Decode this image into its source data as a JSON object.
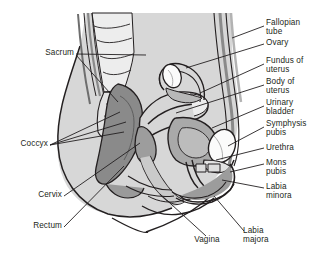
{
  "figure": {
    "width": 323,
    "height": 264,
    "background_color": "#ffffff",
    "line_color": "#231f20",
    "label_color": "#231f20"
  },
  "palette": {
    "skin_outer": "#d9d9d9",
    "body_fill": "#cfcfcf",
    "muscle_light": "#e2e2e2",
    "bone_light": "#ededed",
    "organ_mid": "#b3b3b3",
    "organ_dark": "#8a8a8a",
    "organ_darker": "#6e6e6e",
    "white_structure": "#fbfbfb",
    "outline": "#231f20"
  },
  "labels": {
    "right": [
      {
        "id": "fallopian-tube",
        "text": "Fallopian\ntube",
        "x": 266,
        "y": 21,
        "leader": [
          [
            264,
            26
          ],
          [
            232,
            38
          ]
        ]
      },
      {
        "id": "ovary",
        "text": "Ovary",
        "x": 266,
        "y": 40,
        "leader": [
          [
            264,
            44
          ],
          [
            186,
            68
          ]
        ]
      },
      {
        "id": "fundus-of-uterus",
        "text": "Fundus of\nuterus",
        "x": 266,
        "y": 59,
        "leader": [
          [
            264,
            64
          ],
          [
            200,
            93
          ]
        ]
      },
      {
        "id": "body-of-uterus",
        "text": "Body of\nuterus",
        "x": 266,
        "y": 80,
        "leader": [
          [
            264,
            85
          ],
          [
            178,
            112
          ]
        ]
      },
      {
        "id": "urinary-bladder",
        "text": "Urinary\nbladder",
        "x": 266,
        "y": 101,
        "leader": [
          [
            264,
            106
          ],
          [
            214,
            126
          ]
        ]
      },
      {
        "id": "symphysis-pubis",
        "text": "Symphysis\npubis",
        "x": 266,
        "y": 122,
        "leader": [
          [
            264,
            127
          ],
          [
            225,
            145
          ]
        ]
      },
      {
        "id": "urethra",
        "text": "Urethra",
        "x": 266,
        "y": 145,
        "leader": [
          [
            264,
            148
          ],
          [
            218,
            160
          ]
        ]
      },
      {
        "id": "mons-pubis",
        "text": "Mons\npubis",
        "x": 266,
        "y": 160,
        "leader": [
          [
            264,
            164
          ],
          [
            229,
            174
          ]
        ]
      },
      {
        "id": "labia-minora",
        "text": "Labia\nminora",
        "x": 266,
        "y": 184,
        "leader": [
          [
            264,
            188
          ],
          [
            214,
            184
          ]
        ]
      },
      {
        "id": "labia-majora",
        "text": "Labia\nmajora",
        "x": 243,
        "y": 233,
        "leader": [
          [
            244,
            234
          ],
          [
            205,
            194
          ]
        ]
      }
    ],
    "left": [
      {
        "id": "sacrum",
        "text": "Sacrum",
        "x": 32,
        "y": 50,
        "leader": [
          [
            76,
            54
          ],
          [
            144,
            55
          ]
        ]
      },
      {
        "id": "coccyx",
        "text": "Coccyx",
        "x": 4,
        "y": 141,
        "leader": [
          [
            50,
            145
          ],
          [
            118,
            112
          ]
        ]
      },
      {
        "id": "cervix",
        "text": "Cervix",
        "x": 26,
        "y": 193,
        "leader": [
          [
            64,
            197
          ],
          [
            124,
            152
          ]
        ]
      },
      {
        "id": "rectum",
        "text": "Rectum",
        "x": 22,
        "y": 224,
        "leader": [
          [
            64,
            228
          ],
          [
            120,
            178
          ]
        ]
      }
    ],
    "bottom": [
      {
        "id": "vagina",
        "text": "Vagina",
        "x": 190,
        "y": 239,
        "leader": [
          [
            206,
            238
          ],
          [
            162,
            196
          ]
        ]
      }
    ]
  },
  "leaders_extra": {
    "sacrum_second": [
      [
        76,
        55
      ],
      [
        118,
        100
      ]
    ],
    "coccyx_second": [
      [
        50,
        146
      ],
      [
        124,
        134
      ]
    ],
    "coccyx_third": [
      [
        50,
        146
      ],
      [
        126,
        120
      ]
    ]
  }
}
